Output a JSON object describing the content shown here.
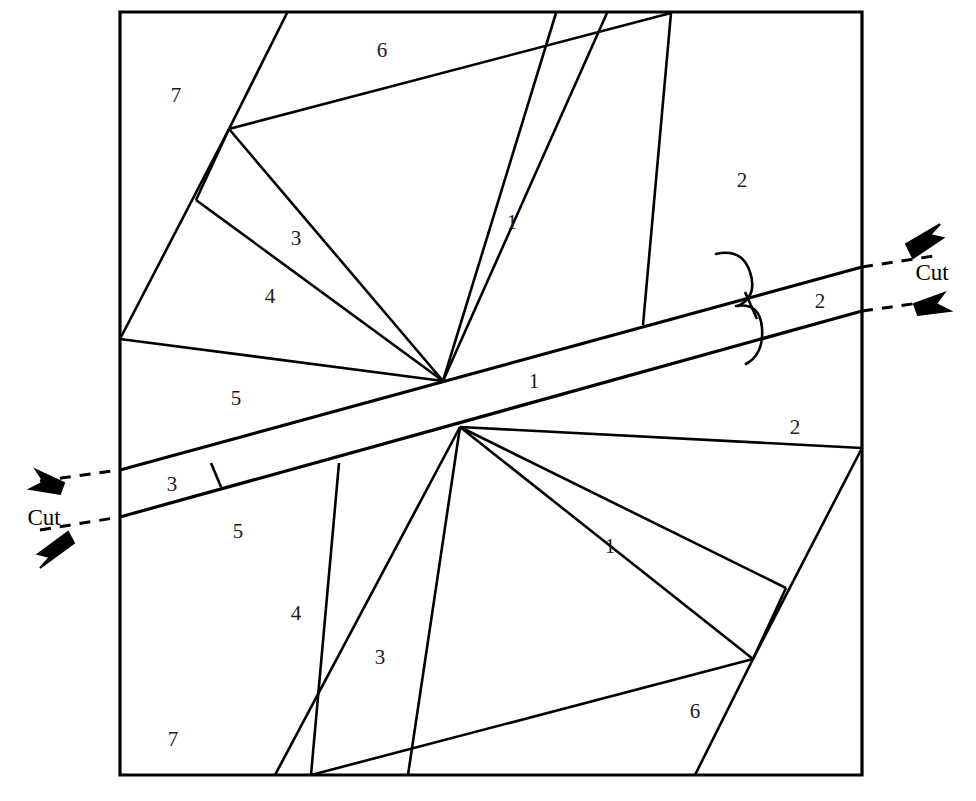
{
  "figure": {
    "stroke_color": "#000000",
    "label_color": "#1b1b1b",
    "background": "#ffffff",
    "square": {
      "left": 120,
      "top": 12,
      "right": 862,
      "bottom": 775
    }
  },
  "piece_labels": [
    {
      "id": "piece-label-7-top",
      "text": "7",
      "x": 176,
      "y": 95
    },
    {
      "id": "piece-label-6-top",
      "text": "6",
      "x": 382,
      "y": 50
    },
    {
      "id": "piece-label-3-top",
      "text": "3",
      "x": 296,
      "y": 238
    },
    {
      "id": "piece-label-4-top",
      "text": "4",
      "x": 270,
      "y": 296
    },
    {
      "id": "piece-label-1-top",
      "text": "1",
      "x": 512,
      "y": 222
    },
    {
      "id": "piece-label-2-top",
      "text": "2",
      "x": 742,
      "y": 180
    },
    {
      "id": "piece-label-2-strip",
      "text": "2",
      "x": 820,
      "y": 301
    },
    {
      "id": "piece-label-5-top",
      "text": "5",
      "x": 236,
      "y": 398
    },
    {
      "id": "piece-label-1-strip",
      "text": "1",
      "x": 534,
      "y": 381
    },
    {
      "id": "piece-label-2-bottom",
      "text": "2",
      "x": 795,
      "y": 427
    },
    {
      "id": "piece-label-3-strip",
      "text": "3",
      "x": 172,
      "y": 484
    },
    {
      "id": "piece-label-5-bottom",
      "text": "5",
      "x": 238,
      "y": 531
    },
    {
      "id": "piece-label-1-bottom",
      "text": "1",
      "x": 610,
      "y": 546
    },
    {
      "id": "piece-label-4-bottom",
      "text": "4",
      "x": 296,
      "y": 613
    },
    {
      "id": "piece-label-3-bottom",
      "text": "3",
      "x": 380,
      "y": 657
    },
    {
      "id": "piece-label-6-bottom",
      "text": "6",
      "x": 695,
      "y": 711
    },
    {
      "id": "piece-label-7-bottom",
      "text": "7",
      "x": 173,
      "y": 739
    }
  ],
  "cut_annotations": [
    {
      "id": "cut-label-left",
      "text": "Cut",
      "x": 44,
      "y": 518
    },
    {
      "id": "cut-label-right",
      "text": "Cut",
      "x": 932,
      "y": 273
    }
  ],
  "geometry": {
    "square_path": "M120,12 L862,12 L862,775 L120,775 Z",
    "strip_upper_edge": "M120,470 L862,267",
    "strip_lower_edge": "M120,517 L862,311",
    "upper_half_lines": [
      "M287,13 L229,129",
      "M229,129 L120,339",
      "M229,129 L671,13",
      "M229,129 L443,381",
      "M196,200 L443,381",
      "M120,339 L443,381",
      "M671,13 L643,325"
    ],
    "lower_half_lines": [
      "M695,775 L753,659",
      "M753,659 L862,448",
      "M753,659 L311,775",
      "M753,659 L460,427",
      "M786,588 L460,427",
      "M862,448 L460,427",
      "M311,775 L339,463"
    ],
    "fan_extra_upper": [
      "M196,200 L229,129"
    ],
    "fan_extra_lower": [
      "M786,588 L753,659"
    ],
    "lower_fan_rays": [
      "M460,427 L275,775",
      "M460,427 L408,775"
    ],
    "upper_fan_rays": [
      "M443,381 L607,13",
      "M443,381 L556,13"
    ],
    "strip_crossline_left": "M211,463 L221,487",
    "strip_crossline_right": "M745,292 L757,319",
    "dashed_cut_left_upper": "M40,481 L120,470",
    "dashed_cut_left_lower": "M40,530 L120,517",
    "dashed_cut_right_upper": "M862,267 L940,255",
    "dashed_cut_right_lower": "M862,311 L940,300"
  }
}
